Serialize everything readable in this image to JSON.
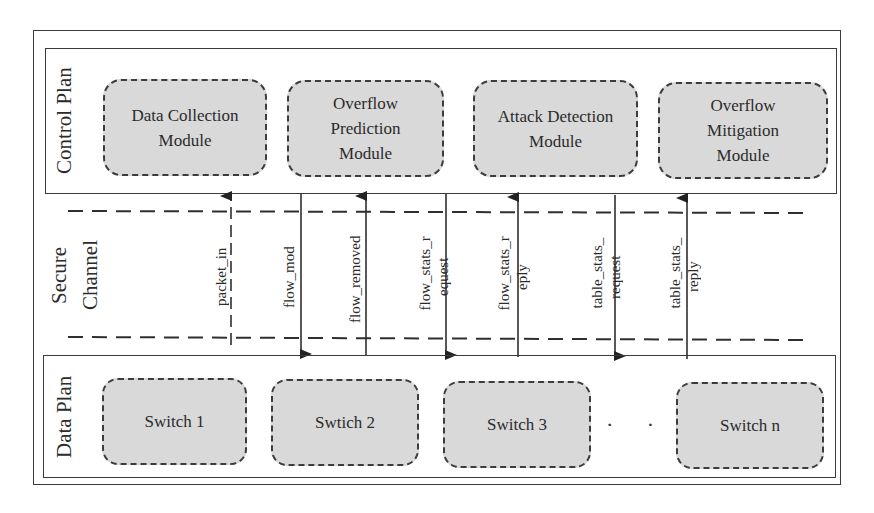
{
  "control_plane": {
    "label": "Control Plan",
    "modules": [
      {
        "line1": "Data Collection",
        "line2": "Module",
        "line3": ""
      },
      {
        "line1": "Overflow",
        "line2": "Prediction",
        "line3": "Module"
      },
      {
        "line1": "Attack Detection",
        "line2": "Module",
        "line3": ""
      },
      {
        "line1": "Overflow",
        "line2": "Mitigation",
        "line3": "Module"
      }
    ]
  },
  "secure_channel": {
    "label_line1": "Secure",
    "label_line2": "Channel",
    "messages": [
      {
        "label": "packet_in",
        "line2": "",
        "direction": "up",
        "style": "dashed"
      },
      {
        "label": "flow_mod",
        "line2": "",
        "direction": "down",
        "style": "solid"
      },
      {
        "label": "flow_removed",
        "line2": "",
        "direction": "up",
        "style": "solid"
      },
      {
        "label": "flow_stats_r",
        "line2": "equest",
        "direction": "down",
        "style": "solid"
      },
      {
        "label": "flow_stats_r",
        "line2": "eply",
        "direction": "up",
        "style": "solid"
      },
      {
        "label": "table_stats_",
        "line2": "request",
        "direction": "down",
        "style": "solid"
      },
      {
        "label": "table_stats_",
        "line2": "reply",
        "direction": "up",
        "style": "solid"
      }
    ]
  },
  "data_plane": {
    "label": "Data Plan",
    "switches": [
      "Switch 1",
      "Swtich 2",
      "Switch 3",
      "Switch n"
    ],
    "ellipsis": "· · ·"
  },
  "colors": {
    "module_fill": "#d9d9d9",
    "stroke": "#2f2f2f"
  }
}
